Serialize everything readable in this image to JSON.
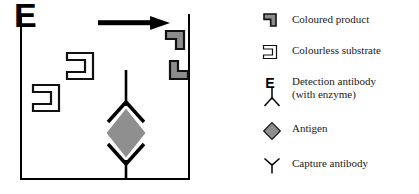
{
  "figure": {
    "type": "elisa-sandwich-assay-diagram",
    "colors": {
      "outline": "#000000",
      "fill_gray": "#8c8c8c",
      "antigen_gray": "#8f8f8f",
      "background": "#ffffff",
      "text": "#1a1a1a"
    }
  },
  "well": {
    "name": "reaction-well",
    "arrow_direction": "right",
    "contents": [
      {
        "name": "colourless-substrate",
        "count": 2,
        "style": "outline"
      },
      {
        "name": "coloured-product",
        "count": 2,
        "style": "filled-gray"
      },
      {
        "name": "detection-antibody-with-enzyme",
        "enzyme_letter": "E"
      },
      {
        "name": "antigen",
        "shape": "diamond"
      },
      {
        "name": "capture-antibody",
        "shape": "y"
      }
    ]
  },
  "legend": {
    "items": [
      {
        "icon": "coloured-product-icon",
        "label": "Coloured product"
      },
      {
        "icon": "colourless-substrate-icon",
        "label": "Colourless substrate"
      },
      {
        "icon": "detection-antibody-icon",
        "label": "Detection antibody\n(with enzyme)"
      },
      {
        "icon": "antigen-icon",
        "label": "Antigen"
      },
      {
        "icon": "capture-antibody-icon",
        "label": "Capture antibody"
      }
    ]
  }
}
